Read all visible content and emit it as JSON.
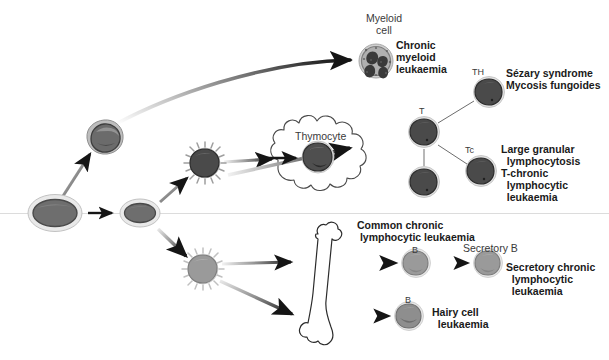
{
  "figure": {
    "background_color": "#ffffff",
    "baseline_color": "#d7d7d7"
  },
  "labels": {
    "myeloid_cell": "Myeloid\ncell",
    "chronic_myeloid_leukaemia": "Chronic\nmyeloid\nleukaemia",
    "thymocyte": "Thymocyte",
    "t_cell": "T",
    "t_helper": "TH",
    "sezary_mycosis": "Sézary syndrome\nMycosis fungoides",
    "t_cytotoxic": "Tc",
    "large_granular": "Large granular\n  lymphocytosis\nT-chronic\n  lymphocytic\n  leukaemia",
    "common_chronic": "Common chronic\n lymphocytic leukaemia",
    "b_cell_top": "B",
    "b_cell_bottom": "B",
    "secretory_b": "Secretory B",
    "secretory_chronic": "Secretory chronic\n  lymphocytic\n  leukaemia",
    "hairy_cell": "Hairy cell\n  leukaemia"
  },
  "cells": [
    {
      "id": "stem-cell-1",
      "name": "stem-cell",
      "x": 55,
      "y": 213,
      "rx": 26,
      "ry": 17,
      "type": "oval",
      "fill": "#6e6e6e",
      "ring": "#cfcfcf"
    },
    {
      "id": "stem-cell-2",
      "name": "stem-cell",
      "x": 140,
      "y": 213,
      "rx": 19,
      "ry": 13,
      "type": "oval",
      "fill": "#6e6e6e",
      "ring": "#cfcfcf"
    },
    {
      "id": "myeloid-precursor",
      "name": "myeloid-precursor-cell",
      "x": 104,
      "y": 136,
      "rx": 17,
      "ry": 15,
      "type": "blob",
      "fill": "#6b6b6b",
      "ring": "#9a9a9a"
    },
    {
      "id": "lymphoid-precursor",
      "name": "lymphoid-precursor-cell",
      "x": 205,
      "y": 163,
      "rx": 14,
      "ry": 14,
      "type": "spiky",
      "fill": "#4a4a4a",
      "ring": "#b5b5b5"
    },
    {
      "id": "b-precursor",
      "name": "b-precursor-cell",
      "x": 203,
      "y": 269,
      "rx": 14,
      "ry": 14,
      "type": "spiky",
      "fill": "#9a9a9a",
      "ring": "#c9c9c9"
    },
    {
      "id": "myeloid-cell",
      "name": "myeloid-cell",
      "x": 376,
      "y": 61,
      "rx": 16,
      "ry": 16,
      "type": "granular",
      "fill": "#8a8a8a",
      "ring": "#bdbdbd"
    },
    {
      "id": "thymocyte-cell",
      "name": "thymocyte-cell",
      "x": 318,
      "y": 157,
      "rx": 15,
      "ry": 14,
      "type": "blob",
      "fill": "#4f4f4f",
      "ring": "#c6c6c6"
    },
    {
      "id": "t-cell-upper",
      "name": "t-cell",
      "x": 424,
      "y": 132,
      "rx": 14,
      "ry": 14,
      "type": "blob",
      "fill": "#4a4a4a",
      "ring": "#c2c2c2"
    },
    {
      "id": "t-cell-lower",
      "name": "t-cell",
      "x": 424,
      "y": 182,
      "rx": 14,
      "ry": 14,
      "type": "blob",
      "fill": "#4a4a4a",
      "ring": "#c2c2c2"
    },
    {
      "id": "th-cell",
      "name": "t-helper-cell",
      "x": 489,
      "y": 92,
      "rx": 14,
      "ry": 14,
      "type": "blob",
      "fill": "#4a4a4a",
      "ring": "#c2c2c2"
    },
    {
      "id": "tc-cell",
      "name": "t-cytotoxic-cell",
      "x": 481,
      "y": 171,
      "rx": 14,
      "ry": 14,
      "type": "blob",
      "fill": "#4a4a4a",
      "ring": "#c2c2c2"
    },
    {
      "id": "b-cell-top",
      "name": "b-cell",
      "x": 416,
      "y": 263,
      "rx": 13,
      "ry": 13,
      "type": "blob",
      "fill": "#9a9a9a",
      "ring": "#d0d0d0"
    },
    {
      "id": "secretory-b-cell",
      "name": "secretory-b-cell",
      "x": 488,
      "y": 263,
      "rx": 13,
      "ry": 13,
      "type": "blob",
      "fill": "#9a9a9a",
      "ring": "#d0d0d0"
    },
    {
      "id": "b-cell-bottom",
      "name": "b-cell",
      "x": 409,
      "y": 316,
      "rx": 13,
      "ry": 13,
      "type": "blob",
      "fill": "#8e8e8e",
      "ring": "#d0d0d0"
    }
  ],
  "organs": [
    {
      "id": "thymus",
      "name": "thymus-outline",
      "cx": 318,
      "cy": 152,
      "label": "Thymocyte"
    },
    {
      "id": "bone",
      "name": "bone-outline",
      "cx": 325,
      "cy": 290,
      "label": ""
    }
  ],
  "arrows": [
    {
      "name": "arrow-stem-to-stem",
      "from": [
        86,
        213
      ],
      "to": [
        117,
        213
      ]
    },
    {
      "name": "arrow-stem-to-myeloid-lineage",
      "from": [
        68,
        193
      ],
      "to": [
        92,
        152
      ]
    },
    {
      "name": "arrow-stem-to-lymphoid",
      "from": [
        163,
        200
      ],
      "to": [
        189,
        177
      ]
    },
    {
      "name": "arrow-stem-to-b-lineage",
      "from": [
        160,
        228
      ],
      "to": [
        189,
        257
      ]
    },
    {
      "name": "arrow-myeloid-curve",
      "from": [
        118,
        122
      ],
      "to": [
        356,
        61
      ]
    },
    {
      "name": "arrow-lymphoid-to-thymus",
      "from": [
        226,
        163
      ],
      "to": [
        275,
        160
      ]
    },
    {
      "name": "arrow-thymus-to-tcells",
      "from": [
        222,
        170
      ],
      "to": [
        352,
        148
      ]
    },
    {
      "name": "arrow-b-to-bone-upper",
      "from": [
        224,
        264
      ],
      "to": [
        295,
        261
      ]
    },
    {
      "name": "arrow-b-to-bone-lower",
      "from": [
        222,
        281
      ],
      "to": [
        296,
        316
      ]
    },
    {
      "name": "arrow-bone-to-bcell",
      "from": [
        355,
        263
      ],
      "to": [
        399,
        263
      ]
    },
    {
      "name": "arrow-bcell-to-secretory",
      "from": [
        438,
        263
      ],
      "to": [
        470,
        263
      ]
    },
    {
      "name": "arrow-bone-to-hairy",
      "from": [
        355,
        316
      ],
      "to": [
        392,
        316
      ]
    }
  ],
  "connectors": [
    {
      "name": "connector-t-to-th",
      "from": [
        437,
        123
      ],
      "to": [
        474,
        100
      ]
    },
    {
      "name": "connector-t-to-tc",
      "from": [
        437,
        146
      ],
      "to": [
        468,
        166
      ]
    },
    {
      "name": "connector-t-to-t",
      "from": [
        424,
        148
      ],
      "to": [
        424,
        166
      ]
    }
  ],
  "label_positions": {
    "myeloid_cell": {
      "x": 358,
      "y": 14,
      "align": "center",
      "style": "plain",
      "w": 54
    },
    "chronic_myeloid_leukaemia": {
      "x": 396,
      "y": 42,
      "align": "left",
      "style": "bold",
      "w": 80
    },
    "thymocyte": {
      "x": 296,
      "y": 131,
      "align": "left",
      "style": "plain",
      "w": 60
    },
    "t_cell": {
      "x": 418,
      "y": 107,
      "align": "left",
      "style": "sm",
      "w": 12
    },
    "t_helper": {
      "x": 473,
      "y": 68,
      "align": "left",
      "style": "sm",
      "w": 18
    },
    "sezary_mycosis": {
      "x": 505,
      "y": 69,
      "align": "left",
      "style": "bold",
      "w": 100
    },
    "t_cytotoxic": {
      "x": 466,
      "y": 146,
      "align": "left",
      "style": "sm",
      "w": 18
    },
    "large_granular": {
      "x": 502,
      "y": 145,
      "align": "left",
      "style": "bold",
      "w": 105
    },
    "common_chronic": {
      "x": 357,
      "y": 221,
      "align": "left",
      "style": "bold",
      "w": 120
    },
    "b_cell_top": {
      "x": 411,
      "y": 247,
      "align": "left",
      "style": "sm",
      "w": 10
    },
    "secretory_b": {
      "x": 464,
      "y": 245,
      "align": "left",
      "style": "plain",
      "w": 66
    },
    "secretory_chronic": {
      "x": 505,
      "y": 263,
      "align": "left",
      "style": "bold",
      "w": 100
    },
    "b_cell_bottom": {
      "x": 404,
      "y": 297,
      "align": "left",
      "style": "sm",
      "w": 10
    },
    "hairy_cell": {
      "x": 432,
      "y": 308,
      "align": "left",
      "style": "bold",
      "w": 80
    }
  }
}
